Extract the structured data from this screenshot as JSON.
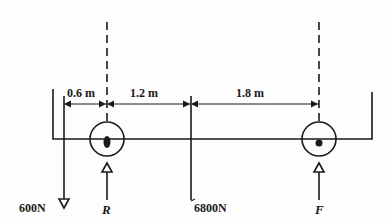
{
  "diagram": {
    "type": "beam-free-body",
    "stroke_color": "#1a1a1a",
    "dimensions": [
      {
        "id": "d1",
        "label": "0.6 m"
      },
      {
        "id": "d2",
        "label": "1.2 m"
      },
      {
        "id": "d3",
        "label": "1.8 m"
      }
    ],
    "forces": [
      {
        "id": "load-left",
        "label": "600N",
        "direction": "down"
      },
      {
        "id": "support-R",
        "label": "R",
        "direction": "up"
      },
      {
        "id": "load-center",
        "label": "6800N",
        "direction": "down"
      },
      {
        "id": "support-F",
        "label": "F",
        "direction": "up"
      }
    ]
  }
}
